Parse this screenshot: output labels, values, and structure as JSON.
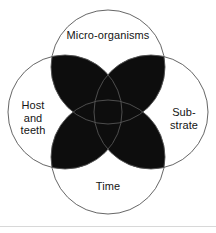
{
  "figure": {
    "circle_outline_color": "#555555",
    "overlap_fill_color": "#0d0d0d",
    "background_color": "#ffffff",
    "text_color": "#141414",
    "circles": [
      {
        "id": "micro-organisms",
        "label": "Micro-organisms",
        "cx": 108,
        "cy": 67,
        "r": 57,
        "position": "top"
      },
      {
        "id": "host-and-teeth",
        "label": "Host\nand\nteeth",
        "cx": 65,
        "cy": 112,
        "r": 57,
        "position": "left"
      },
      {
        "id": "substrate",
        "label": "Sub-\nstrate",
        "cx": 151,
        "cy": 112,
        "r": 57,
        "position": "right"
      },
      {
        "id": "time",
        "label": "Time",
        "cx": 108,
        "cy": 157,
        "r": 57,
        "position": "bottom"
      }
    ],
    "labels": {
      "top": "Micro-organisms",
      "left": "Host\nand\nteeth",
      "right": "Sub-\nstrate",
      "bottom": "Time"
    }
  }
}
